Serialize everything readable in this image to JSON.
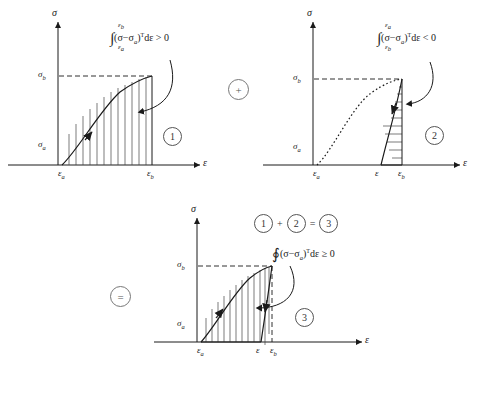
{
  "figure": {
    "line_color": "#1a1a1a",
    "hatch_color": "#444444"
  },
  "axis": {
    "sigma": "σ",
    "epsilon": "ε"
  },
  "operators": {
    "plus": "+",
    "equals": "=",
    "sum_plus": "+",
    "sum_equals": "="
  },
  "panels": [
    {
      "id": "panel-1",
      "badge": "1",
      "y_axis_label": "σ",
      "x_axis_label": "ε",
      "y_ticks": [
        {
          "label": "σ",
          "subscript": "b"
        },
        {
          "label": "σ",
          "subscript": "a"
        }
      ],
      "x_ticks": [
        {
          "label": "ε",
          "subscript": "a"
        },
        {
          "label": "ε",
          "subscript": "b"
        }
      ],
      "integral": {
        "upper_limit": "ε",
        "upper_limit_sub": "b",
        "lower_limit": "ε",
        "lower_limit_sub": "a",
        "symbol": "∫",
        "integrand": "(σ−σ",
        "integrand_sub": "a",
        "integrand_tail": ")",
        "transpose": "T",
        "differential": "dε",
        "relation": "> 0"
      },
      "hatch_style": "vertical",
      "curve_style": "solid",
      "arrow_direction": "up-right"
    },
    {
      "id": "panel-2",
      "badge": "2",
      "y_axis_label": "σ",
      "x_axis_label": "ε",
      "y_ticks": [
        {
          "label": "σ",
          "subscript": "b"
        },
        {
          "label": "σ",
          "subscript": "a"
        }
      ],
      "x_ticks": [
        {
          "label": "ε",
          "subscript": "a"
        },
        {
          "label": "ε",
          "subscript": ""
        },
        {
          "label": "ε",
          "subscript": "b"
        }
      ],
      "integral": {
        "upper_limit": "ε",
        "upper_limit_sub": "a",
        "lower_limit": "ε",
        "lower_limit_sub": "b",
        "symbol": "∫",
        "integrand": "(σ−σ",
        "integrand_sub": "a",
        "integrand_tail": ")",
        "transpose": "T",
        "differential": "dε",
        "relation": "< 0"
      },
      "hatch_style": "horizontal",
      "curve_style": "dotted",
      "arrow_direction": "down"
    },
    {
      "id": "panel-3",
      "badge": "3",
      "y_axis_label": "σ",
      "x_axis_label": "ε",
      "y_ticks": [
        {
          "label": "σ",
          "subscript": "b"
        },
        {
          "label": "σ",
          "subscript": "a"
        }
      ],
      "x_ticks": [
        {
          "label": "ε",
          "subscript": "a"
        },
        {
          "label": "ε",
          "subscript": ""
        },
        {
          "label": "ε",
          "subscript": "b"
        }
      ],
      "integral": {
        "symbol": "∮",
        "integrand": "(σ−σ",
        "integrand_sub": "a",
        "integrand_tail": ")",
        "transpose": "T",
        "differential": "dε",
        "relation": "≥ 0"
      },
      "hatch_style": "vertical",
      "curve_style": "solid-closed-loop",
      "arrow_direction": "cycle"
    }
  ],
  "sum_equation": {
    "term1": "1",
    "op1": "+",
    "term2": "2",
    "op2": "=",
    "result": "3"
  }
}
